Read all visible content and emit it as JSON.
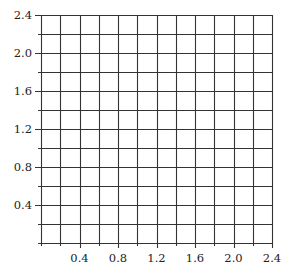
{
  "chart_data": {
    "type": "scatter",
    "title": "",
    "xlabel": "",
    "ylabel": "",
    "xlim": [
      0,
      2.4
    ],
    "ylim": [
      0,
      2.4
    ],
    "grid": true,
    "grid_step": 0.2,
    "x_ticks": [
      "0.4",
      "0.8",
      "1.2",
      "1.6",
      "2.0",
      "2.4"
    ],
    "y_ticks": [
      "2.4",
      "2.0",
      "1.6",
      "1.2",
      "0.8",
      "0.4"
    ],
    "series": [],
    "note": "Empty square grid (12×12 cells, 0.2 units each); text above the grid is cut off and illegible"
  },
  "colors": {
    "grid": "#333333",
    "label": "#222222",
    "background": "#ffffff"
  },
  "layout": {
    "plot_left": 41,
    "plot_right": 272,
    "plot_top": 15,
    "plot_bottom": 243,
    "divisions": 12
  }
}
